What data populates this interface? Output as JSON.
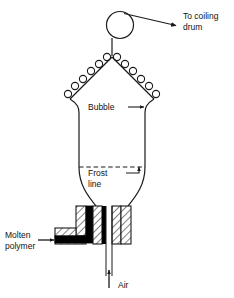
{
  "diagram": {
    "type": "process-schematic",
    "colors": {
      "line": "#1a1a1a",
      "text": "#111111",
      "background": "#ffffff",
      "polymer_fill": "#000000",
      "die_hatch": "#ffffff"
    },
    "labels": {
      "to_coiling_drum_line1": "To coiling",
      "to_coiling_drum_line2": "drum",
      "bubble": "Bubble",
      "frost_line_line1": "Frost",
      "frost_line_line2": "line",
      "molten_polymer_line1": "Molten",
      "molten_polymer_line2": "polymer",
      "air": "Air"
    },
    "components": {
      "take_up_roller": "circle-roller",
      "guide_rollers_left_count": 6,
      "guide_rollers_right_count": 6,
      "bubble_shape": "elongated-cylinder-with-conical-ends",
      "frost_line_style": "dashed-horizontal",
      "die_style": "cross-hatched-annular-die",
      "polymer_channel": "L-shaped-black-filled",
      "air_inlet": "center-vertical-arrow-up"
    }
  }
}
